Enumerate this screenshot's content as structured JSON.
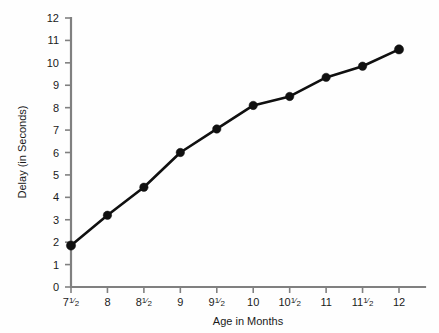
{
  "chart_data": {
    "type": "line",
    "title": "",
    "xlabel": "Age in Months",
    "ylabel": "Delay (in Seconds)",
    "x": [
      7.5,
      8,
      8.5,
      9,
      9.5,
      10,
      10.5,
      11,
      11.5,
      12
    ],
    "values": [
      1.85,
      3.2,
      4.45,
      6.0,
      7.05,
      8.1,
      8.5,
      9.35,
      9.85,
      10.6
    ],
    "x_tick_labels": [
      "7½",
      "8",
      "8½",
      "9",
      "9½",
      "10",
      "10½",
      "11",
      "11½",
      "12"
    ],
    "x_tick_whole": [
      "7",
      "8",
      "8",
      "9",
      "9",
      "10",
      "10",
      "11",
      "11",
      "12"
    ],
    "x_tick_frac": [
      "1/2",
      "",
      "1/2",
      "",
      "1/2",
      "",
      "1/2",
      "",
      "1/2",
      ""
    ],
    "y_tick_labels": [
      "0",
      "1",
      "2",
      "3",
      "4",
      "5",
      "6",
      "7",
      "8",
      "9",
      "10",
      "11",
      "12"
    ],
    "ylim": [
      0,
      12
    ],
    "xlim": [
      7.5,
      12
    ],
    "grid": false,
    "legend": "none",
    "marker": "filled-circle",
    "line_color": "#101010",
    "axis_color": "#808080",
    "background_color": "#fefefe"
  }
}
